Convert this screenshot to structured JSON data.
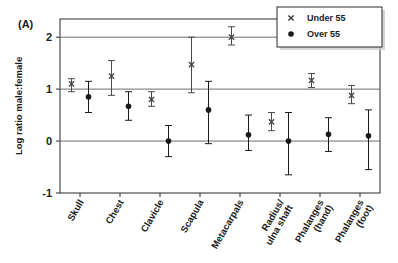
{
  "figure": {
    "panel_label": "(A)"
  },
  "legend": {
    "position": "top-right",
    "entries": [
      {
        "label": "Under 55",
        "marker": "cross-marker",
        "color": "#3f3f3f"
      },
      {
        "label": "Over 55",
        "marker": "filled-circle-marker",
        "color": "#1a1a1a"
      }
    ]
  },
  "chart_data": {
    "type": "scatter",
    "title": "",
    "subtitle": "",
    "xlabel": "",
    "ylabel": "Log ratio male:female",
    "ylim": [
      -1,
      2.35
    ],
    "yticks": [
      -1,
      0,
      1,
      2
    ],
    "ytick_labels": [
      "-1",
      "0",
      "1",
      "2"
    ],
    "grid": true,
    "gridlines_at": [
      0,
      1,
      2
    ],
    "error_bars": true,
    "categories": [
      "Skull",
      "Chest",
      "Clavicle",
      "Scapula",
      "Metacarpals",
      "Radius/\nulna shaft",
      "Phalanges\n(hand)",
      "Phalanges\n(foot)"
    ],
    "series": [
      {
        "name": "Under 55",
        "marker": "cross-marker",
        "color": "#4a4a4a",
        "values": [
          1.1,
          1.25,
          0.8,
          1.47,
          2.0,
          0.37,
          1.17,
          0.88
        ],
        "ci_low": [
          0.95,
          0.88,
          0.67,
          0.93,
          1.85,
          0.2,
          1.03,
          0.72
        ],
        "ci_high": [
          1.2,
          1.55,
          0.95,
          2.0,
          2.2,
          0.55,
          1.3,
          1.07
        ]
      },
      {
        "name": "Over 55",
        "marker": "filled-circle-marker",
        "color": "#1a1a1a",
        "values": [
          0.85,
          0.67,
          0.0,
          0.6,
          0.12,
          0.0,
          0.13,
          0.1
        ],
        "ci_low": [
          0.55,
          0.4,
          -0.3,
          -0.05,
          -0.18,
          -0.65,
          -0.2,
          -0.55
        ],
        "ci_high": [
          1.15,
          0.95,
          0.3,
          1.15,
          0.5,
          0.55,
          0.45,
          0.6
        ]
      }
    ]
  }
}
